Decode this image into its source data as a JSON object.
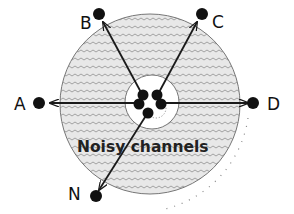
{
  "diagram": {
    "region_label": "Noisy channels",
    "nodes": [
      {
        "id": "A",
        "label": "A"
      },
      {
        "id": "B",
        "label": "B"
      },
      {
        "id": "C",
        "label": "C"
      },
      {
        "id": "D",
        "label": "D"
      },
      {
        "id": "N",
        "label": "N"
      }
    ],
    "colors": {
      "node": "#111111",
      "arrow": "#1a1a1a",
      "circle_outline": "#777777",
      "noise_pattern": "#9a9a9a",
      "fill": "#e6e6e6"
    }
  }
}
